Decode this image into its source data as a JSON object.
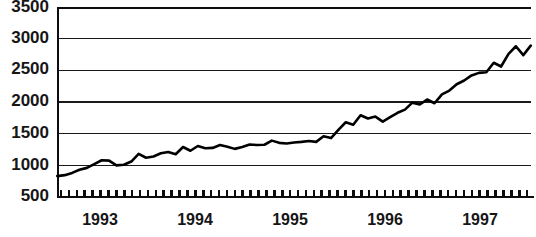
{
  "chart_data": {
    "type": "line",
    "title": "",
    "subtitle": "",
    "xlabel": "",
    "ylabel": "",
    "ylim": [
      500,
      3500
    ],
    "xlim": [
      1992.58,
      1997.92
    ],
    "grid": true,
    "legend": false,
    "yticks": [
      500,
      1000,
      1500,
      2000,
      2500,
      3000,
      3500
    ],
    "ytick_labels": [
      "500",
      "1000",
      "1500",
      "2000",
      "2500",
      "3000",
      "3500"
    ],
    "xtick_labels": [
      "1993",
      "1994",
      "1995",
      "1996",
      "1997"
    ],
    "xtick_positions": [
      1993.0,
      1994.0,
      1995.0,
      1996.0,
      1997.0
    ],
    "minor_tick_interval": "month",
    "line_color": "#000000",
    "series": [
      {
        "name": "index",
        "x": [
          1992.583,
          1992.667,
          1992.75,
          1992.833,
          1992.917,
          1993.0,
          1993.083,
          1993.167,
          1993.25,
          1993.333,
          1993.417,
          1993.5,
          1993.583,
          1993.667,
          1993.75,
          1993.833,
          1993.917,
          1994.0,
          1994.083,
          1994.167,
          1994.25,
          1994.333,
          1994.417,
          1994.5,
          1994.583,
          1994.667,
          1994.75,
          1994.833,
          1994.917,
          1995.0,
          1995.083,
          1995.167,
          1995.25,
          1995.333,
          1995.417,
          1995.5,
          1995.583,
          1995.667,
          1995.75,
          1995.833,
          1995.917,
          1996.0,
          1996.083,
          1996.167,
          1996.25,
          1996.333,
          1996.417,
          1996.5,
          1996.583,
          1996.667,
          1996.75,
          1996.833,
          1996.917,
          1997.0,
          1997.083,
          1997.167,
          1997.25,
          1997.333,
          1997.417,
          1997.5,
          1997.583,
          1997.667,
          1997.75,
          1997.833,
          1997.917
        ],
        "values": [
          830,
          845,
          880,
          930,
          960,
          1020,
          1080,
          1075,
          1000,
          1010,
          1060,
          1180,
          1120,
          1140,
          1190,
          1210,
          1175,
          1290,
          1230,
          1305,
          1270,
          1275,
          1320,
          1295,
          1260,
          1290,
          1330,
          1320,
          1325,
          1390,
          1355,
          1345,
          1360,
          1370,
          1385,
          1370,
          1460,
          1430,
          1560,
          1680,
          1640,
          1790,
          1740,
          1770,
          1690,
          1760,
          1830,
          1880,
          1990,
          1960,
          2040,
          1980,
          2120,
          2180,
          2280,
          2340,
          2420,
          2460,
          2470,
          2620,
          2560,
          2760,
          2880,
          2740,
          2890
        ]
      }
    ],
    "extra_points": {
      "late_peak_x": 1997.75,
      "late_peak_value": 3050,
      "final_value": 2720
    }
  },
  "axes": {
    "plot_left_px": 57,
    "plot_right_px": 531,
    "plot_top_px": 7,
    "plot_bottom_px": 197
  }
}
